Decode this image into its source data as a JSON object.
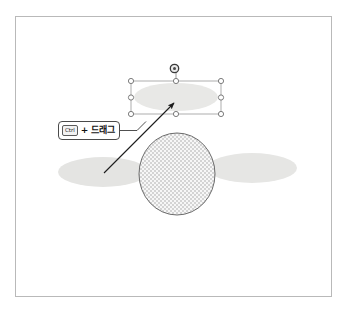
{
  "document": {
    "title": "Shape duplication illustration",
    "frame": {
      "border_color": "#b9b9b9",
      "background": "#ffffff"
    }
  },
  "callout": {
    "name": "ctrl-drag-hint",
    "key_label": "Ctrl",
    "plus": "+",
    "action_label": "드래그",
    "full_text": "Ctrl + 드래그",
    "border_color": "#4a4a4a",
    "background": "#ffffff"
  },
  "shapes": {
    "center_circle": {
      "name": "center-circle",
      "label": "",
      "fill_pattern": "checkerboard",
      "fill_color": "#d8d8d8",
      "background_color": "#f7f7f7",
      "stroke_color": "#6b6b6b",
      "cx": 177,
      "cy": 174,
      "rx": 38,
      "ry": 41
    },
    "left_wing": {
      "name": "left-wing-ellipse",
      "label": "",
      "fill_color": "#e4e4e2",
      "stroke_color": "none",
      "cx": 103,
      "cy": 172,
      "rx": 45,
      "ry": 15
    },
    "right_wing": {
      "name": "right-wing-ellipse",
      "label": "",
      "fill_color": "#e6e6e4",
      "stroke_color": "none",
      "cx": 252,
      "cy": 168,
      "rx": 45,
      "ry": 15
    },
    "selected_ellipse": {
      "name": "selected-copy-ellipse",
      "label": "",
      "fill_color": "#e8e8e6",
      "stroke_color": "none",
      "cx": 176,
      "cy": 97,
      "rx": 42,
      "ry": 14
    }
  },
  "selection": {
    "name": "selection-bounding-box",
    "stroke_color": "#9a9a9a",
    "x": 131,
    "y": 81,
    "width": 90,
    "height": 33,
    "handle_fill": "#ffffff",
    "handle_stroke": "#6e6e6e",
    "handle_radius": 2.6,
    "handles": [
      {
        "name": "handle-top-left",
        "x": 131,
        "y": 81
      },
      {
        "name": "handle-top-center",
        "x": 176,
        "y": 81
      },
      {
        "name": "handle-top-right",
        "x": 221,
        "y": 81
      },
      {
        "name": "handle-middle-left",
        "x": 131,
        "y": 97.5
      },
      {
        "name": "handle-middle-right",
        "x": 221,
        "y": 97.5
      },
      {
        "name": "handle-bottom-left",
        "x": 131,
        "y": 114
      },
      {
        "name": "handle-bottom-center",
        "x": 176,
        "y": 114
      },
      {
        "name": "handle-bottom-right",
        "x": 221,
        "y": 114
      }
    ],
    "rotation_handle": {
      "name": "rotation-handle",
      "x": 174,
      "y": 68,
      "radius": 4.2,
      "stem_to_y": 81,
      "fill": "#e9e9e9",
      "stroke": "#3a3a3a"
    }
  },
  "drag_arrow": {
    "name": "drag-direction-arrow",
    "stroke_color": "#1c1c1c",
    "from_x": 104,
    "from_y": 173,
    "to_x": 176,
    "to_y": 101
  },
  "leader_line": {
    "name": "callout-leader-line",
    "stroke_color": "#3c3c3c",
    "from_x": 119,
    "from_y": 131,
    "to_x": 144,
    "to_y": 131,
    "bend_x": 135,
    "bend_y": 131
  }
}
